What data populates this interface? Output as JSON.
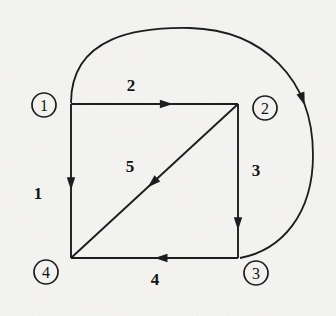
{
  "figure": {
    "kind": "directed-graph-diagram",
    "background_color": "#f7f7f5",
    "ink_color": "#1d1d1f",
    "width": 336,
    "height": 316
  },
  "nodes": [
    {
      "id": "n1",
      "label": "1",
      "cx": 44,
      "cy": 105,
      "r": 12
    },
    {
      "id": "n2",
      "label": "2",
      "cx": 265,
      "cy": 108,
      "r": 12
    },
    {
      "id": "n3",
      "label": "3",
      "cx": 256,
      "cy": 273,
      "r": 12
    },
    {
      "id": "n4",
      "label": "4",
      "cx": 46,
      "cy": 272,
      "r": 12
    }
  ],
  "edges": [
    {
      "id": "e1",
      "label": "1",
      "from": "n1",
      "to": "n4",
      "shape": "straight",
      "x1": 71,
      "y1": 104,
      "x2": 71,
      "y2": 258,
      "arrow_t": 0.56,
      "label_x": 38,
      "label_y": 193
    },
    {
      "id": "e2",
      "label": "2",
      "from": "n1",
      "to": "n2",
      "shape": "straight",
      "x1": 71,
      "y1": 104,
      "x2": 238,
      "y2": 104,
      "arrow_t": 0.61,
      "label_x": 131,
      "label_y": 85
    },
    {
      "id": "e3",
      "label": "3",
      "from": "n2",
      "to": "n3",
      "shape": "straight",
      "x1": 238,
      "y1": 104,
      "x2": 238,
      "y2": 258,
      "arrow_t": 0.82,
      "label_x": 256,
      "label_y": 170
    },
    {
      "id": "e4",
      "label": "4",
      "from": "n3",
      "to": "n4",
      "shape": "straight",
      "x1": 238,
      "y1": 258,
      "x2": 71,
      "y2": 258,
      "arrow_t": 0.5,
      "label_x": 155,
      "label_y": 279
    },
    {
      "id": "e5",
      "label": "5",
      "from": "n2",
      "to": "n4",
      "shape": "diagonal",
      "x1": 238,
      "y1": 104,
      "x2": 71,
      "y2": 258,
      "arrow_t": 0.54,
      "label_x": 130,
      "label_y": 166
    },
    {
      "id": "e6",
      "label": "",
      "from": "n1",
      "to": "n3",
      "shape": "arc",
      "path": "M 71 103 C 71 35, 140 27, 190 28 C 262 30, 313 78, 313 155 C 313 214, 282 250, 240 258",
      "arrow_t": 0.62,
      "label_x": 0,
      "label_y": 0
    }
  ],
  "arrowhead": {
    "length": 13,
    "half_width": 4.2
  }
}
